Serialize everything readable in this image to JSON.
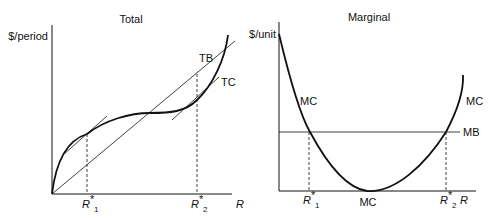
{
  "left_panel": {
    "title": "Total",
    "ylabel": "$/period",
    "xlabel": "R",
    "curves": {
      "tb": "TB",
      "tc": "TC"
    },
    "ticks": [
      {
        "main": "R",
        "sup": "*",
        "sub": "1"
      },
      {
        "main": "R",
        "sup": "*",
        "sub": "2"
      }
    ]
  },
  "right_panel": {
    "title": "Marginal",
    "ylabel": "$/unit",
    "xlabel": "R",
    "curves": {
      "mc_left": "MC",
      "mc_right": "MC",
      "mc_bottom": "MC",
      "mb": "MB"
    },
    "ticks": [
      {
        "main": "R",
        "sup": "*",
        "sub": "1"
      },
      {
        "main": "R",
        "sup": "*",
        "sub": "2"
      }
    ]
  },
  "colors": {
    "ink": "#111111",
    "background": "#ffffff"
  }
}
